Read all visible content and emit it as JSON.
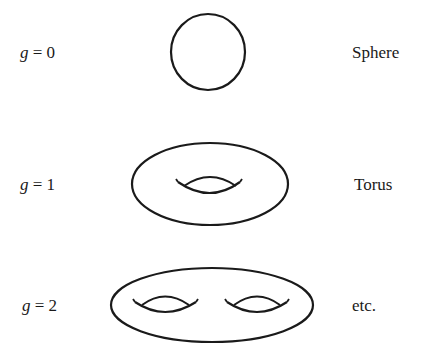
{
  "rows": [
    {
      "genus_var": "g",
      "genus_eq": " = 0",
      "name": "Sphere"
    },
    {
      "genus_var": "g",
      "genus_eq": " = 1",
      "name": "Torus"
    },
    {
      "genus_var": "g",
      "genus_eq": " = 2",
      "name": "etc."
    }
  ],
  "colors": {
    "stroke": "#1a1a1a",
    "background": "#ffffff"
  }
}
